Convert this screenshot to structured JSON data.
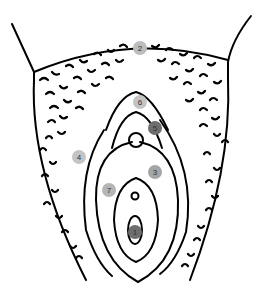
{
  "diagram": {
    "type": "anatomical line drawing with numbered markers",
    "markers": [
      {
        "label": "1",
        "x": 135,
        "y": 232,
        "color": "#6e6e6e"
      },
      {
        "label": "2",
        "x": 140,
        "y": 48,
        "color": "#bdbdbd"
      },
      {
        "label": "3",
        "x": 155,
        "y": 172,
        "color": "#a6a6a6"
      },
      {
        "label": "4",
        "x": 79,
        "y": 157,
        "color": "#c4c4c4"
      },
      {
        "label": "5",
        "x": 155,
        "y": 128,
        "color": "#6e6e6e"
      },
      {
        "label": "6",
        "x": 140,
        "y": 102,
        "color": "#c4c4c4"
      },
      {
        "label": "7",
        "x": 109,
        "y": 190,
        "color": "#b5b5b5"
      }
    ]
  }
}
